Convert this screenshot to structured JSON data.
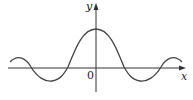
{
  "diagram": {
    "type": "function-graph",
    "x_axis_label": "x",
    "y_axis_label": "y",
    "origin_label": "0",
    "curve": "damped oscillation symmetric about y-axis (sinc-like)",
    "colors": {
      "axis": "#333333",
      "curve": "#444444",
      "background": "#ffffff"
    }
  }
}
